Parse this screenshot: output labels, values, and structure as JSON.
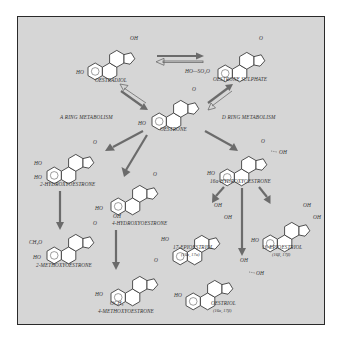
{
  "diagram": {
    "sections": {
      "a_ring": "A RING METABOLISM",
      "d_ring": "D RING METABOLISM"
    },
    "compounds": {
      "oestradiol": {
        "name": "OESTRADIOL",
        "groups": [
          "OH",
          "HO"
        ]
      },
      "oestrone_sulphate": {
        "name": "OESTRONE SULPHATE",
        "groups": [
          "O",
          "HO—SO₂O"
        ]
      },
      "oestrone": {
        "name": "OESTRONE",
        "groups": [
          "O",
          "HO"
        ]
      },
      "hydroxyoestrone_2": {
        "name": "2-HYDROXYOESTRONE",
        "groups": [
          "O",
          "HO",
          "HO"
        ]
      },
      "hydroxyoestrone_4": {
        "name": "4-HYDROXYOESTRONE",
        "groups": [
          "O",
          "HO",
          "OH"
        ]
      },
      "hydroxyoestrone_16a": {
        "name": "16α-HYDROXYOESTRONE",
        "groups": [
          "O",
          "OH",
          "HO"
        ]
      },
      "methoxyoestrone_2": {
        "name": "2-METHOXYOESTRONE",
        "groups": [
          "O",
          "CH₃O",
          "HO"
        ]
      },
      "methoxyoestrone_4": {
        "name": "4-METHOXYOESTRONE",
        "groups": [
          "O",
          "HO",
          "OCH₃"
        ]
      },
      "epioestriol_17": {
        "name": "17-EPIOESTRIOL",
        "stereo": "(16α, 17α)",
        "groups": [
          "OH",
          "OH",
          "HO"
        ]
      },
      "epioestriol_16": {
        "name": "16-EPIOESTRIOL",
        "stereo": "(16β, 17β)",
        "groups": [
          "OH",
          "OH",
          "HO"
        ]
      },
      "oestriol": {
        "name": "OESTRIOL",
        "stereo": "(16α, 17β)",
        "groups": [
          "OH",
          "OH",
          "HO"
        ]
      }
    },
    "arrows": [
      {
        "from": "oestradiol",
        "to": "oestrone_sulphate",
        "style": "solid"
      },
      {
        "from": "oestrone_sulphate",
        "to": "oestradiol",
        "style": "hollow"
      },
      {
        "from": "oestradiol",
        "to": "oestrone",
        "style": "solid"
      },
      {
        "from": "oestrone",
        "to": "oestradiol",
        "style": "hollow"
      },
      {
        "from": "oestrone",
        "to": "oestrone_sulphate",
        "style": "solid"
      },
      {
        "from": "oestrone_sulphate",
        "to": "oestrone",
        "style": "hollow"
      },
      {
        "from": "oestrone",
        "to": "hydroxyoestrone_2",
        "style": "solid"
      },
      {
        "from": "oestrone",
        "to": "hydroxyoestrone_4",
        "style": "solid"
      },
      {
        "from": "oestrone",
        "to": "hydroxyoestrone_16a",
        "style": "solid"
      },
      {
        "from": "hydroxyoestrone_2",
        "to": "methoxyoestrone_2",
        "style": "solid"
      },
      {
        "from": "hydroxyoestrone_4",
        "to": "methoxyoestrone_4",
        "style": "solid"
      },
      {
        "from": "hydroxyoestrone_16a",
        "to": "epioestriol_17",
        "style": "solid"
      },
      {
        "from": "hydroxyoestrone_16a",
        "to": "oestriol",
        "style": "solid"
      },
      {
        "from": "hydroxyoestrone_16a",
        "to": "epioestriol_16",
        "style": "solid"
      }
    ],
    "colors": {
      "background": "#d6d6d6",
      "frame": "#2a2a2a",
      "arrow": "#6b6b6b",
      "text": "#333333"
    }
  }
}
